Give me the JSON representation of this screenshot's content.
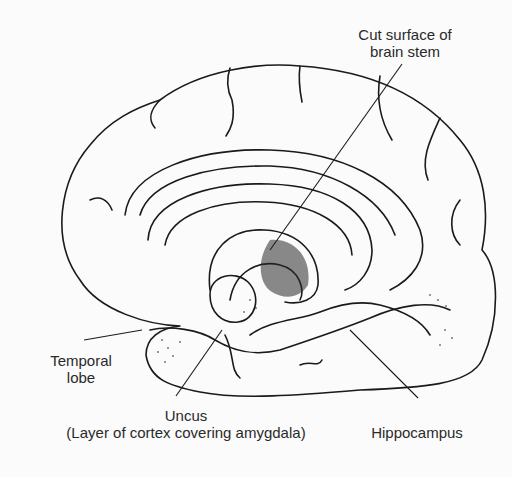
{
  "diagram": {
    "labels": {
      "brain_stem_line1": "Cut surface of",
      "brain_stem_line2": "brain stem",
      "temporal_line1": "Temporal",
      "temporal_line2": "lobe",
      "uncus_line1": "Uncus",
      "uncus_line2": "(Layer of cortex covering amygdala)",
      "hippocampus": "Hippocampus"
    },
    "colors": {
      "ink": "#1a1a1a",
      "background": "#fbfbfb"
    }
  }
}
